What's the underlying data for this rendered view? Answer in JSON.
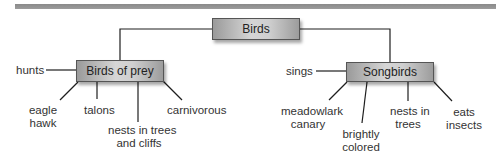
{
  "diagram": {
    "root": {
      "label": "Birds"
    },
    "branches": [
      {
        "label": "Birds of prey",
        "attributes": [
          {
            "id": "hunts",
            "text": "hunts"
          },
          {
            "id": "examples",
            "line1": "eagle",
            "line2": "hawk"
          },
          {
            "id": "talons",
            "text": "talons"
          },
          {
            "id": "nests",
            "line1": "nests in trees",
            "line2": "and cliffs"
          },
          {
            "id": "diet",
            "text": "carnivorous"
          }
        ]
      },
      {
        "label": "Songbirds",
        "attributes": [
          {
            "id": "sings",
            "text": "sings"
          },
          {
            "id": "examples",
            "line1": "meadowlark",
            "line2": "canary"
          },
          {
            "id": "color",
            "line1": "brightly",
            "line2": "colored"
          },
          {
            "id": "nests",
            "line1": "nests in",
            "line2": "trees"
          },
          {
            "id": "diet",
            "line1": "eats",
            "line2": "insects"
          }
        ]
      }
    ],
    "colors": {
      "box_gradient_edge": "#9a9a9a",
      "box_gradient_center": "#d6d6d6",
      "line": "#1e1e1e",
      "top_bar": "#929292",
      "text": "#333333"
    }
  }
}
